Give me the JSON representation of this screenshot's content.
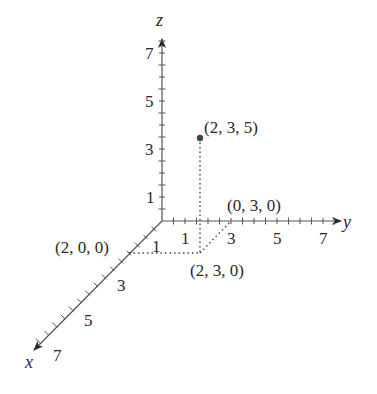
{
  "diagram": {
    "type": "3d-coordinate-axes",
    "axes": {
      "x": {
        "label": "x",
        "tick_labels": [
          "1",
          "3",
          "5",
          "7"
        ]
      },
      "y": {
        "label": "y",
        "tick_labels": [
          "1",
          "3",
          "5",
          "7"
        ]
      },
      "z": {
        "label": "z",
        "tick_labels": [
          "1",
          "3",
          "5",
          "7"
        ]
      }
    },
    "points": [
      {
        "label": "(2, 3, 5)",
        "coords": [
          2,
          3,
          5
        ]
      },
      {
        "label": "(0, 3, 0)",
        "coords": [
          0,
          3,
          0
        ]
      },
      {
        "label": "(2, 0, 0)",
        "coords": [
          2,
          0,
          0
        ]
      },
      {
        "label": "(2, 3, 0)",
        "coords": [
          2,
          3,
          0
        ]
      }
    ],
    "colors": {
      "ink": "#2a2a2a",
      "axis": "#555555",
      "dot": "#444444"
    }
  }
}
